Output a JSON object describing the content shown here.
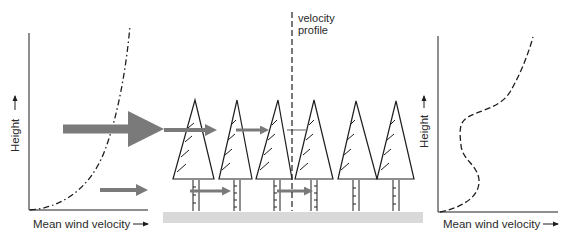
{
  "colors": {
    "line": "#1e1e1e",
    "arrow": "#7a7a7a",
    "ground": "#d9d9d9",
    "background": "#ffffff"
  },
  "left_chart": {
    "y_label": "Height",
    "x_label": "Mean wind velocity",
    "curve_style": "dash-dot"
  },
  "center_scene": {
    "profile_label_line1": "velocity",
    "profile_label_line2": "profile",
    "tree_count": 6,
    "ground": "ground-strip"
  },
  "right_chart": {
    "y_label": "Height",
    "x_label": "Mean wind velocity",
    "curve_style": "dashed"
  },
  "arrow_glyph": "→"
}
